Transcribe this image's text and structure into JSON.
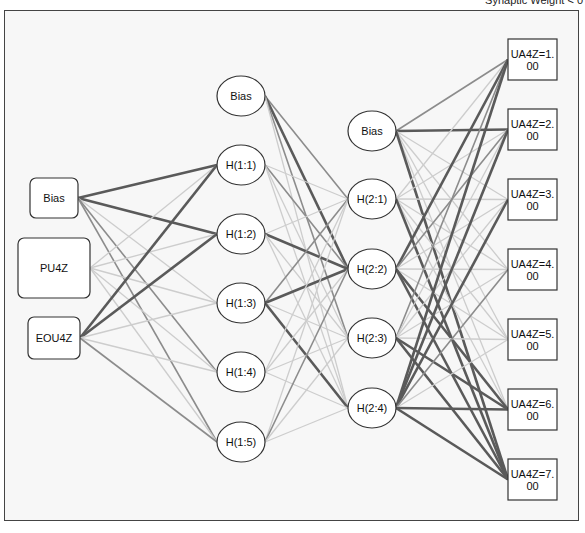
{
  "caption": "Synaptic Weight < 0",
  "colors": {
    "frame_border": "#444444",
    "background": "#f7f7f7",
    "node_stroke": "#333333",
    "strong_edge": "#5a5a5a",
    "medium_edge": "#8c8c8c",
    "weak_edge": "#cdcdcd"
  },
  "layers": {
    "input": [
      {
        "id": "in_bias",
        "label": "Bias",
        "shape": "rbox",
        "x": 30,
        "y": 178,
        "w": 48,
        "h": 40
      },
      {
        "id": "in_pu4z",
        "label": "PU4Z",
        "shape": "rbox",
        "x": 18,
        "y": 238,
        "w": 72,
        "h": 60
      },
      {
        "id": "in_eou4z",
        "label": "EOU4Z",
        "shape": "rbox",
        "x": 28,
        "y": 317,
        "w": 52,
        "h": 42
      }
    ],
    "hidden1": [
      {
        "id": "h1_bias",
        "label": "Bias",
        "shape": "ellipse",
        "cx": 241,
        "cy": 96
      },
      {
        "id": "h1_1",
        "label": "H(1:1)",
        "shape": "ellipse",
        "cx": 241,
        "cy": 165
      },
      {
        "id": "h1_2",
        "label": "H(1:2)",
        "shape": "ellipse",
        "cx": 241,
        "cy": 234
      },
      {
        "id": "h1_3",
        "label": "H(1:3)",
        "shape": "ellipse",
        "cx": 241,
        "cy": 303
      },
      {
        "id": "h1_4",
        "label": "H(1:4)",
        "shape": "ellipse",
        "cx": 241,
        "cy": 372
      },
      {
        "id": "h1_5",
        "label": "H(1:5)",
        "shape": "ellipse",
        "cx": 241,
        "cy": 442
      }
    ],
    "hidden2": [
      {
        "id": "h2_bias",
        "label": "Bias",
        "shape": "ellipse",
        "cx": 372,
        "cy": 131
      },
      {
        "id": "h2_1",
        "label": "H(2:1)",
        "shape": "ellipse",
        "cx": 372,
        "cy": 199
      },
      {
        "id": "h2_2",
        "label": "H(2:2)",
        "shape": "ellipse",
        "cx": 372,
        "cy": 269
      },
      {
        "id": "h2_3",
        "label": "H(2:3)",
        "shape": "ellipse",
        "cx": 372,
        "cy": 338
      },
      {
        "id": "h2_4",
        "label": "H(2:4)",
        "shape": "ellipse",
        "cx": 372,
        "cy": 408
      }
    ],
    "output": [
      {
        "id": "out_1",
        "label_line1": "UA4Z=1.",
        "label_line2": "00",
        "shape": "box",
        "x": 508,
        "y": 39,
        "w": 49,
        "h": 41
      },
      {
        "id": "out_2",
        "label_line1": "UA4Z=2.",
        "label_line2": "00",
        "shape": "box",
        "x": 508,
        "y": 109,
        "w": 49,
        "h": 41
      },
      {
        "id": "out_3",
        "label_line1": "UA4Z=3.",
        "label_line2": "00",
        "shape": "box",
        "x": 508,
        "y": 179,
        "w": 49,
        "h": 41
      },
      {
        "id": "out_4",
        "label_line1": "UA4Z=4.",
        "label_line2": "00",
        "shape": "box",
        "x": 508,
        "y": 249,
        "w": 49,
        "h": 41
      },
      {
        "id": "out_5",
        "label_line1": "UA4Z=5.",
        "label_line2": "00",
        "shape": "box",
        "x": 508,
        "y": 319,
        "w": 49,
        "h": 41
      },
      {
        "id": "out_6",
        "label_line1": "UA4Z=6.",
        "label_line2": "00",
        "shape": "box",
        "x": 508,
        "y": 389,
        "w": 49,
        "h": 41
      },
      {
        "id": "out_7",
        "label_line1": "UA4Z=7.",
        "label_line2": "00",
        "shape": "box",
        "x": 508,
        "y": 459,
        "w": 49,
        "h": 41
      }
    ]
  },
  "edges_in_h1": [
    [
      "in_bias",
      "h1_1",
      "s"
    ],
    [
      "in_bias",
      "h1_2",
      "s"
    ],
    [
      "in_bias",
      "h1_3",
      "w"
    ],
    [
      "in_bias",
      "h1_4",
      "m"
    ],
    [
      "in_bias",
      "h1_5",
      "m"
    ],
    [
      "in_pu4z",
      "h1_1",
      "w"
    ],
    [
      "in_pu4z",
      "h1_2",
      "w"
    ],
    [
      "in_pu4z",
      "h1_3",
      "w"
    ],
    [
      "in_pu4z",
      "h1_4",
      "w"
    ],
    [
      "in_pu4z",
      "h1_5",
      "w"
    ],
    [
      "in_eou4z",
      "h1_1",
      "s"
    ],
    [
      "in_eou4z",
      "h1_2",
      "s"
    ],
    [
      "in_eou4z",
      "h1_3",
      "w"
    ],
    [
      "in_eou4z",
      "h1_4",
      "w"
    ],
    [
      "in_eou4z",
      "h1_5",
      "m"
    ]
  ],
  "edges_h1_h2": [
    [
      "h1_bias",
      "h2_1",
      "m"
    ],
    [
      "h1_bias",
      "h2_2",
      "s"
    ],
    [
      "h1_bias",
      "h2_3",
      "m"
    ],
    [
      "h1_bias",
      "h2_4",
      "w"
    ],
    [
      "h1_1",
      "h2_1",
      "w"
    ],
    [
      "h1_1",
      "h2_2",
      "m"
    ],
    [
      "h1_1",
      "h2_3",
      "w"
    ],
    [
      "h1_1",
      "h2_4",
      "w"
    ],
    [
      "h1_2",
      "h2_1",
      "w"
    ],
    [
      "h1_2",
      "h2_2",
      "s"
    ],
    [
      "h1_2",
      "h2_3",
      "w"
    ],
    [
      "h1_2",
      "h2_4",
      "w"
    ],
    [
      "h1_3",
      "h2_1",
      "m"
    ],
    [
      "h1_3",
      "h2_2",
      "s"
    ],
    [
      "h1_3",
      "h2_3",
      "w"
    ],
    [
      "h1_3",
      "h2_4",
      "s"
    ],
    [
      "h1_4",
      "h2_1",
      "w"
    ],
    [
      "h1_4",
      "h2_2",
      "w"
    ],
    [
      "h1_4",
      "h2_3",
      "w"
    ],
    [
      "h1_4",
      "h2_4",
      "w"
    ],
    [
      "h1_5",
      "h2_1",
      "w"
    ],
    [
      "h1_5",
      "h2_2",
      "m"
    ],
    [
      "h1_5",
      "h2_3",
      "w"
    ],
    [
      "h1_5",
      "h2_4",
      "w"
    ]
  ],
  "edges_h2_out": [
    [
      "h2_bias",
      "out_1",
      "m"
    ],
    [
      "h2_bias",
      "out_2",
      "s"
    ],
    [
      "h2_bias",
      "out_3",
      "w"
    ],
    [
      "h2_bias",
      "out_4",
      "w"
    ],
    [
      "h2_bias",
      "out_5",
      "w"
    ],
    [
      "h2_bias",
      "out_6",
      "w"
    ],
    [
      "h2_bias",
      "out_7",
      "s"
    ],
    [
      "h2_1",
      "out_1",
      "w"
    ],
    [
      "h2_1",
      "out_2",
      "w"
    ],
    [
      "h2_1",
      "out_3",
      "w"
    ],
    [
      "h2_1",
      "out_4",
      "w"
    ],
    [
      "h2_1",
      "out_5",
      "w"
    ],
    [
      "h2_1",
      "out_6",
      "w"
    ],
    [
      "h2_1",
      "out_7",
      "s"
    ],
    [
      "h2_2",
      "out_1",
      "s"
    ],
    [
      "h2_2",
      "out_2",
      "m"
    ],
    [
      "h2_2",
      "out_3",
      "w"
    ],
    [
      "h2_2",
      "out_4",
      "w"
    ],
    [
      "h2_2",
      "out_5",
      "w"
    ],
    [
      "h2_2",
      "out_6",
      "s"
    ],
    [
      "h2_2",
      "out_7",
      "s"
    ],
    [
      "h2_3",
      "out_1",
      "m"
    ],
    [
      "h2_3",
      "out_2",
      "w"
    ],
    [
      "h2_3",
      "out_3",
      "w"
    ],
    [
      "h2_3",
      "out_4",
      "w"
    ],
    [
      "h2_3",
      "out_5",
      "w"
    ],
    [
      "h2_3",
      "out_6",
      "s"
    ],
    [
      "h2_3",
      "out_7",
      "s"
    ],
    [
      "h2_4",
      "out_1",
      "s"
    ],
    [
      "h2_4",
      "out_2",
      "s"
    ],
    [
      "h2_4",
      "out_3",
      "s"
    ],
    [
      "h2_4",
      "out_4",
      "m"
    ],
    [
      "h2_4",
      "out_5",
      "w"
    ],
    [
      "h2_4",
      "out_6",
      "s"
    ],
    [
      "h2_4",
      "out_7",
      "s"
    ]
  ]
}
